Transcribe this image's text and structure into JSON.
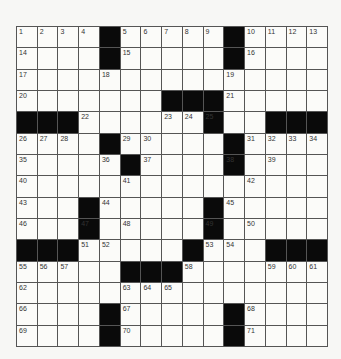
{
  "puzzle": {
    "rows": 15,
    "cols": 15,
    "layout": [
      "....#.....#....",
      "....#.....#....",
      "...............",
      ".......###.....",
      "###......#..###",
      "....#.....#....",
      ".....#....#....",
      "...............",
      "...#.....#.....",
      "...#.....#.....",
      "###.....#...###",
      ".....###.......",
      "...............",
      "....#.....#....",
      "....#.....#...."
    ],
    "numbers": {
      "0,0": "1",
      "0,1": "2",
      "0,2": "3",
      "0,3": "4",
      "0,5": "5",
      "0,6": "6",
      "0,7": "7",
      "0,8": "8",
      "0,9": "9",
      "0,11": "10",
      "0,12": "11",
      "0,13": "12",
      "0,14": "13",
      "1,0": "14",
      "1,5": "15",
      "1,11": "16",
      "2,0": "17",
      "2,4": "18",
      "2,10": "19",
      "3,0": "20",
      "3,10": "21",
      "4,3": "22",
      "4,7": "23",
      "4,8": "24",
      "4,9": "25",
      "5,0": "26",
      "5,1": "27",
      "5,2": "28",
      "5,5": "29",
      "5,6": "30",
      "5,11": "31",
      "5,12": "32",
      "5,13": "33",
      "5,14": "34",
      "6,0": "35",
      "6,4": "36",
      "6,6": "37",
      "6,10": "38",
      "6,12": "39",
      "7,0": "40",
      "7,5": "41",
      "7,11": "42",
      "8,0": "43",
      "8,4": "44",
      "8,10": "45",
      "9,0": "46",
      "9,3": "47",
      "9,5": "48",
      "9,9": "49",
      "9,11": "50",
      "10,3": "51",
      "10,4": "52",
      "10,9": "53",
      "10,10": "54",
      "11,0": "55",
      "11,1": "56",
      "11,2": "57",
      "11,8": "58",
      "11,12": "59",
      "11,13": "60",
      "11,14": "61",
      "12,0": "62",
      "12,5": "63",
      "12,6": "64",
      "12,7": "65",
      "13,0": "66",
      "13,5": "67",
      "13,11": "68",
      "14,0": "69",
      "14,5": "70",
      "14,11": "71"
    }
  }
}
